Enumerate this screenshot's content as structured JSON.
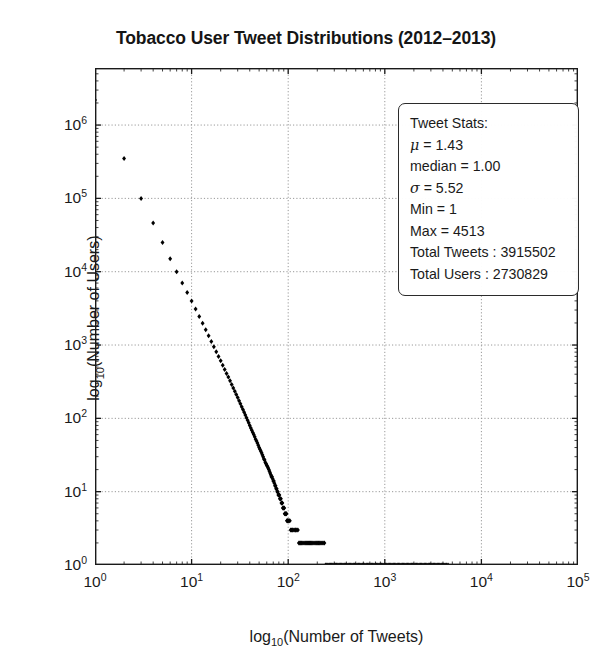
{
  "chart_data": {
    "type": "scatter",
    "title": "Tobacco User Tweet Distributions (2012–2013)",
    "xlabel": "log₁₀(Number of Tweets)",
    "ylabel": "log₁₀(Number of Users)",
    "xscale": "log",
    "yscale": "log",
    "xlim": [
      1,
      100000
    ],
    "ylim": [
      1,
      6000000
    ],
    "grid": true,
    "grid_style": "dotted",
    "legend": "none",
    "marker": "diamond",
    "marker_color": "#000000",
    "xticks": [
      1,
      10,
      100,
      1000,
      10000,
      100000
    ],
    "xtick_labels": [
      "10^0",
      "10^1",
      "10^2",
      "10^3",
      "10^4",
      "10^5"
    ],
    "yticks": [
      1,
      10,
      100,
      1000,
      10000,
      100000,
      1000000
    ],
    "ytick_labels": [
      "10^0",
      "10^1",
      "10^2",
      "10^3",
      "10^4",
      "10^5",
      "10^6"
    ],
    "x": [
      1,
      2,
      3,
      4,
      5,
      6,
      7,
      8,
      9,
      10,
      11,
      12,
      13,
      14,
      15,
      16,
      17,
      18,
      19,
      20,
      21,
      22,
      23,
      24,
      25,
      26,
      27,
      28,
      29,
      30,
      31,
      32,
      33,
      34,
      35,
      36,
      37,
      38,
      39,
      40,
      41,
      42,
      43,
      44,
      45,
      46,
      47,
      48,
      49,
      50,
      51,
      52,
      53,
      54,
      55,
      56,
      57,
      58,
      59,
      60,
      61,
      62,
      63,
      64,
      65,
      66,
      67,
      68,
      69,
      70,
      71,
      72,
      73,
      74,
      75,
      76,
      77,
      78,
      79,
      80,
      81,
      82,
      83,
      84,
      85,
      86,
      87,
      88,
      89,
      90,
      91,
      92,
      93,
      94,
      95,
      96,
      97,
      98,
      99,
      100,
      102,
      104,
      106,
      108,
      110,
      112,
      115,
      118,
      120,
      123,
      126,
      129,
      132,
      135,
      138,
      142,
      146,
      150,
      154,
      158,
      162,
      166,
      170,
      175,
      180,
      185,
      190,
      195,
      200,
      206,
      212,
      218,
      224,
      230,
      237,
      244,
      251,
      258,
      266,
      274,
      282,
      290,
      299,
      308,
      317,
      327,
      337,
      347,
      358,
      369,
      380,
      392,
      404,
      417,
      430,
      443,
      457,
      471,
      486,
      501,
      517,
      533,
      550,
      567,
      585,
      603,
      622,
      642,
      662,
      683,
      704,
      726,
      749,
      772,
      796,
      821,
      847,
      873,
      900,
      928,
      957,
      987,
      1018,
      1050,
      1083,
      1117,
      1152,
      1188,
      1225,
      1263,
      1302,
      1343,
      1385,
      1428,
      1473,
      1519,
      1566,
      1615,
      1665,
      1717,
      1771,
      1826,
      1883,
      1942,
      2003,
      2066,
      2130,
      2197,
      2266,
      2337,
      2410,
      2486,
      2564,
      2644,
      2727,
      2813,
      2901,
      2992,
      3086,
      3183,
      3283,
      3386,
      3492,
      3602,
      3715,
      3832,
      3952,
      4076,
      4204,
      4336,
      4513
    ],
    "y": [
      2200000,
      350000,
      100000,
      46000,
      25000,
      15000,
      10000,
      7000,
      5200,
      4000,
      3100,
      2450,
      1980,
      1620,
      1340,
      1120,
      950,
      810,
      700,
      610,
      530,
      465,
      410,
      365,
      325,
      290,
      260,
      235,
      212,
      192,
      174,
      158,
      144,
      132,
      121,
      111,
      102,
      94,
      87,
      80,
      74,
      69,
      64,
      60,
      56,
      52,
      49,
      46,
      43,
      40,
      38,
      36,
      34,
      32,
      30,
      28,
      27,
      25,
      24,
      23,
      22,
      21,
      20,
      19,
      18,
      17,
      16,
      16,
      15,
      14,
      14,
      13,
      12,
      12,
      11,
      11,
      10,
      10,
      9,
      9,
      9,
      8,
      8,
      8,
      7,
      7,
      7,
      6,
      6,
      6,
      6,
      5,
      5,
      5,
      5,
      5,
      4,
      4,
      4,
      4,
      4,
      4,
      3,
      3,
      3,
      3,
      3,
      3,
      3,
      3,
      3,
      2,
      2,
      2,
      2,
      2,
      2,
      2,
      2,
      2,
      2,
      2,
      2,
      2,
      2,
      2,
      2,
      2,
      2,
      2,
      2,
      2,
      2,
      2,
      2,
      1,
      1,
      1,
      1,
      1,
      1,
      1,
      1,
      1,
      1,
      1,
      1,
      1,
      1,
      1,
      1,
      1,
      1,
      1,
      1,
      1,
      1,
      1,
      1,
      1,
      1,
      1,
      1,
      1,
      1,
      1,
      1,
      1,
      1,
      1,
      1,
      1,
      1,
      1,
      1,
      1,
      1,
      1,
      1,
      1,
      1,
      1,
      1,
      1,
      1,
      1,
      1,
      1,
      1,
      1,
      1,
      1,
      1,
      1,
      1,
      1,
      1,
      1,
      1,
      1,
      1,
      1,
      1,
      1,
      1,
      1,
      1,
      1,
      1,
      1,
      1,
      1,
      1,
      1,
      1,
      1,
      1,
      1,
      1,
      1,
      1,
      1,
      1,
      1,
      1,
      1,
      1,
      1,
      1,
      1,
      1,
      1,
      1,
      1,
      1,
      1,
      1,
      1,
      1,
      1,
      1,
      1,
      1,
      1,
      1,
      1,
      1,
      1,
      1,
      1,
      1,
      1
    ],
    "stats_box": {
      "header": "Tweet Stats:",
      "lines": [
        {
          "symbol": "μ",
          "text": " = 1.43"
        },
        {
          "symbol": "",
          "text": "median = 1.00"
        },
        {
          "symbol": "σ",
          "text": " = 5.52"
        },
        {
          "symbol": "",
          "text": "Min = 1"
        },
        {
          "symbol": "",
          "text": "Max = 4513"
        },
        {
          "symbol": "",
          "text": "Total Tweets : 3915502"
        },
        {
          "symbol": "",
          "text": "Total Users : 2730829"
        }
      ]
    }
  }
}
